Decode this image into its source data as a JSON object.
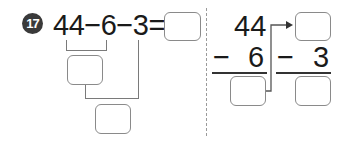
{
  "problem": {
    "number": "17",
    "expression": "44−6−3=",
    "operands": [
      "44",
      "6",
      "3"
    ],
    "operator": "−"
  },
  "vertical": {
    "step1": {
      "top": "44",
      "operator": "−",
      "bottom": "6"
    },
    "step2": {
      "operator": "−",
      "bottom": "3"
    }
  },
  "colors": {
    "badge": "#3a3a3a",
    "box_border": "#8a8a8a",
    "lines": "#7a7a7a",
    "text": "#1a1a1a"
  }
}
